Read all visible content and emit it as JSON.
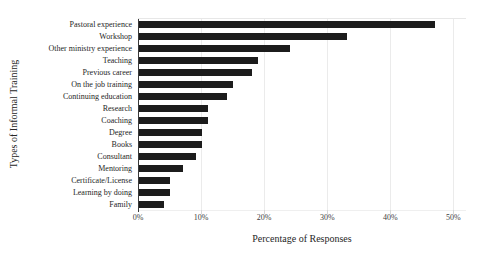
{
  "chart_data": {
    "type": "bar",
    "orientation": "horizontal",
    "title": "",
    "xlabel": "Percentage of Responses",
    "ylabel": "Types of Informal Training",
    "categories": [
      "Pastoral experience",
      "Workshop",
      "Other ministry experience",
      "Teaching",
      "Previous career",
      "On the job training",
      "Continuing education",
      "Research",
      "Coaching",
      "Degree",
      "Books",
      "Consultant",
      "Mentoring",
      "Certificate/License",
      "Learning by doing",
      "Family"
    ],
    "values": [
      47,
      33,
      24,
      19,
      18,
      15,
      14,
      11,
      11,
      10,
      10,
      9,
      7,
      5,
      5,
      4
    ],
    "unit": "%",
    "x_tick_values": [
      0,
      10,
      20,
      30,
      40,
      50
    ],
    "x_tick_labels": [
      "0%",
      "10%",
      "20%",
      "30%",
      "40%",
      "50%"
    ],
    "xlim": [
      0,
      52
    ],
    "grid": "vertical-light",
    "legend": "none",
    "colors": {
      "bar": "#1c1c1c",
      "gridline": "#ebebeb",
      "axis_line": "#3a3a3a",
      "tick_text": "#404040",
      "label_text": "#262626",
      "background": "#ffffff"
    }
  }
}
